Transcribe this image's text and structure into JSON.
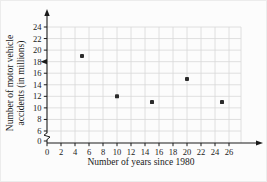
{
  "chart_data": {
    "type": "scatter",
    "title": "",
    "xlabel": "Number of years since 1980",
    "ylabel_line1": "Number of motor vehicle",
    "ylabel_line2": "accidents (in millions)",
    "x_ticks": [
      0,
      2,
      4,
      6,
      8,
      10,
      12,
      14,
      16,
      18,
      20,
      22,
      24,
      26
    ],
    "y_ticks": [
      0,
      6,
      8,
      10,
      12,
      14,
      16,
      18,
      20,
      22,
      24
    ],
    "points": [
      {
        "x": 5,
        "y": 19
      },
      {
        "x": 10,
        "y": 12
      },
      {
        "x": 15,
        "y": 11
      },
      {
        "x": 20,
        "y": 15
      },
      {
        "x": 25,
        "y": 11
      }
    ],
    "xlim": [
      0,
      27
    ],
    "ylim_displayed": [
      0,
      24
    ],
    "y_axis_break_between": [
      0,
      6
    ],
    "y_axis_arrow_marker_at_value": 18,
    "grid": true,
    "grid_step": 2,
    "legend": "none",
    "colors": {
      "axis": "#1a1a1a",
      "grid": "#d8d8d8",
      "point": "#2b2b2b",
      "text": "#1a1a1a",
      "background": "#fcfcfc"
    }
  }
}
